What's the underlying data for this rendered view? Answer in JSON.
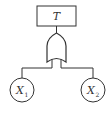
{
  "diagram": {
    "type": "fault-tree",
    "top_event": {
      "label": "T"
    },
    "gate": {
      "type": "OR"
    },
    "basic_events": [
      {
        "label": "X",
        "subscript": "1"
      },
      {
        "label": "X",
        "subscript": "2"
      }
    ],
    "colors": {
      "stroke": "#333333",
      "background": "#ffffff"
    }
  }
}
